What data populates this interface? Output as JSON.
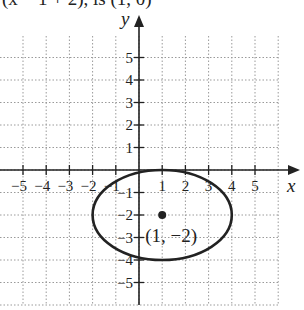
{
  "header": {
    "truncated_text": "(x − 1 + 2), is (1, 0)"
  },
  "chart_data": {
    "type": "scatter",
    "title": "",
    "xlabel": "x",
    "ylabel": "y",
    "xlim": [
      -6,
      6
    ],
    "ylim": [
      -6,
      6
    ],
    "grid": true,
    "x_ticks": [
      "−5",
      "−4",
      "−3",
      "−2",
      "−1",
      "1",
      "2",
      "3",
      "4",
      "5"
    ],
    "y_ticks": [
      "5",
      "4",
      "3",
      "2",
      "1",
      "−1",
      "−2",
      "−3",
      "−4",
      "−5"
    ],
    "series": [
      {
        "name": "ellipse",
        "shape": "ellipse",
        "center": [
          1,
          -2
        ],
        "rx": 3,
        "ry": 2
      },
      {
        "name": "center point",
        "points": [
          [
            1,
            -2
          ]
        ]
      }
    ],
    "annotations": [
      {
        "text": "(1, −2)",
        "x": 1,
        "y": -2
      }
    ]
  }
}
